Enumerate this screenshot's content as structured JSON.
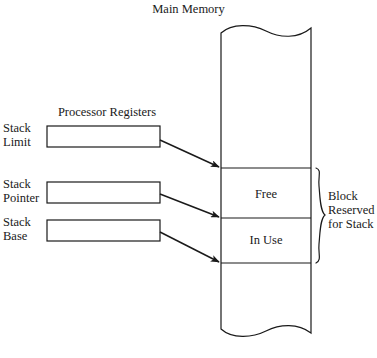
{
  "diagram": {
    "title": "Main Memory",
    "registers_title": "Processor Registers",
    "registers": [
      {
        "label": "Stack\nLimit",
        "value": ""
      },
      {
        "label": "Stack\nPointer",
        "value": ""
      },
      {
        "label": "Stack\nBase",
        "value": ""
      }
    ],
    "memory_sections": [
      {
        "label": "Free"
      },
      {
        "label": "In Use"
      }
    ],
    "brace_label": "Block\nReserved\nfor Stack",
    "colors": {
      "stroke": "#1a1a1a",
      "background": "#ffffff",
      "text": "#1a1a1a"
    }
  }
}
